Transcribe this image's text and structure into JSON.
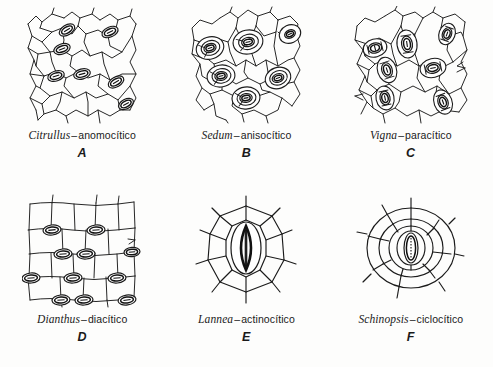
{
  "figure": {
    "background_color": "#fdfdfc",
    "ink_color": "#1b1b1b"
  },
  "panels": [
    {
      "letter": "A",
      "genus": "Citrullus",
      "dash": "–",
      "type": "anomocítico",
      "icon": "stomata-anomocytic-diagram",
      "description": "irregular polygonal epidermal cells with scattered stomata"
    },
    {
      "letter": "B",
      "genus": "Sedum",
      "dash": "–",
      "type": "anisocítico",
      "icon": "stomata-anisocytic-diagram",
      "description": "stomata each surrounded by three unequal subsidiary cells"
    },
    {
      "letter": "C",
      "genus": "Vigna",
      "dash": "–",
      "type": "paracítico",
      "icon": "stomata-paracytic-diagram",
      "description": "stomata flanked by subsidiary cells parallel to the pore"
    },
    {
      "letter": "D",
      "genus": "Dianthus",
      "dash": "–",
      "type": "diacítico",
      "icon": "stomata-diacytic-diagram",
      "description": "rectangular cells in rows with stomata at right angles"
    },
    {
      "letter": "E",
      "genus": "Lannea",
      "dash": "–",
      "type": "actinocítico",
      "icon": "stomata-actinocytic-diagram",
      "description": "single stoma ringed by radiating subsidiary cells"
    },
    {
      "letter": "F",
      "genus": "Schinopsis",
      "dash": "–",
      "type": "ciclocítico",
      "icon": "stomata-cyclocytic-diagram",
      "description": "single stoma ringed by two concentric rings of cells"
    }
  ]
}
